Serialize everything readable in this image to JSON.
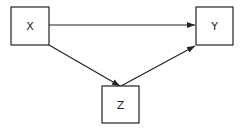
{
  "diagram": {
    "nodes": [
      {
        "id": "X",
        "label": "X",
        "x": 11,
        "y": 7,
        "w": 38,
        "h": 38
      },
      {
        "id": "Y",
        "label": "Y",
        "x": 196,
        "y": 7,
        "w": 37,
        "h": 38
      },
      {
        "id": "Z",
        "label": "Z",
        "x": 102,
        "y": 86,
        "w": 37,
        "h": 37
      }
    ],
    "edges": [
      {
        "from": "X",
        "to": "Y"
      },
      {
        "from": "X",
        "to": "Z"
      },
      {
        "from": "Z",
        "to": "Y"
      }
    ],
    "colors": {
      "stroke": "#222222",
      "background": "#ffffff"
    }
  }
}
